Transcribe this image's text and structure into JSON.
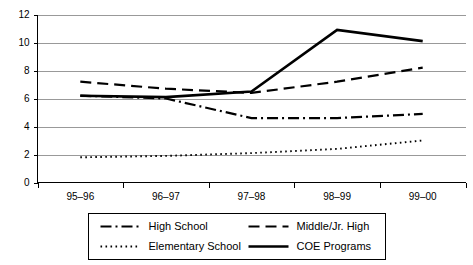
{
  "chart_data": {
    "type": "line",
    "title": "",
    "subtitle": "",
    "xlabel": "",
    "ylabel": "",
    "categories": [
      "95–96",
      "96–97",
      "97–98",
      "98–99",
      "99–00"
    ],
    "ylim": [
      0,
      12
    ],
    "ytick_values": [
      0,
      2,
      4,
      6,
      8,
      10,
      12
    ],
    "ytick_labels": [
      "0",
      "2",
      "4",
      "6",
      "8",
      "10",
      "12"
    ],
    "grid": "horizontal",
    "legend_position": "bottom",
    "series": [
      {
        "name": "High School",
        "style": "dash-dot",
        "color": "#000000",
        "values": [
          6.2,
          6.0,
          4.6,
          4.6,
          4.9
        ]
      },
      {
        "name": "Middle/Jr. High",
        "style": "dashed",
        "color": "#000000",
        "values": [
          7.2,
          6.7,
          6.4,
          7.2,
          8.2
        ]
      },
      {
        "name": "Elementary School",
        "style": "dotted",
        "color": "#000000",
        "values": [
          1.8,
          1.9,
          2.1,
          2.4,
          3.0
        ]
      },
      {
        "name": "COE Programs",
        "style": "solid",
        "color": "#000000",
        "values": [
          6.2,
          6.1,
          6.5,
          10.9,
          10.1
        ]
      }
    ]
  },
  "legend": {
    "entries": [
      {
        "label": "High School",
        "style": "dash-dot"
      },
      {
        "label": "Middle/Jr. High",
        "style": "dashed"
      },
      {
        "label": "Elementary School",
        "style": "dotted"
      },
      {
        "label": "COE Programs",
        "style": "solid"
      }
    ]
  }
}
